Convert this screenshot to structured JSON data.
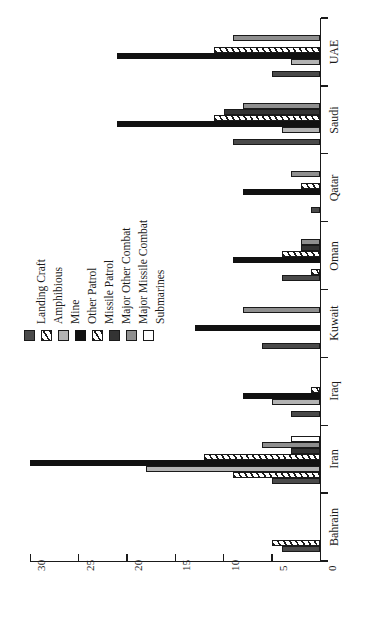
{
  "chart_data": {
    "type": "bar",
    "orientation": "horizontal-rotated",
    "title": "",
    "xlabel": "",
    "ylabel": "",
    "axis_ticks": [
      "30",
      "25",
      "20",
      "15",
      "10",
      "5",
      "0"
    ],
    "axis_tick_values": [
      30,
      25,
      20,
      15,
      10,
      5,
      0
    ],
    "xlim": [
      0,
      30
    ],
    "grid": false,
    "legend_position": "left-center",
    "categories": [
      "Bahrain",
      "Iran",
      "Iraq",
      "Kuwait",
      "Oman",
      "Qatar",
      "Saudi",
      "UAE"
    ],
    "series": [
      {
        "name": "Landing Craft",
        "swatch": "sw-landing",
        "color": "#4a4a4a",
        "values": [
          4,
          5,
          3,
          6,
          4,
          1,
          9,
          5
        ]
      },
      {
        "name": "Amphibious",
        "swatch": "sw-amph",
        "color": "#ffffff",
        "values": [
          5,
          9,
          0,
          0,
          1,
          0,
          0,
          0
        ]
      },
      {
        "name": "Mine",
        "swatch": "sw-mine",
        "color": "#b3b3b3",
        "values": [
          0,
          18,
          5,
          0,
          0,
          0,
          4,
          3
        ]
      },
      {
        "name": "Other Patrol",
        "swatch": "sw-otherpat",
        "color": "#111111",
        "values": [
          0,
          30,
          8,
          13,
          9,
          8,
          21,
          21
        ]
      },
      {
        "name": "Missile Patrol",
        "swatch": "sw-misspat",
        "color": "#ffffff",
        "values": [
          0,
          12,
          1,
          0,
          4,
          2,
          11,
          11
        ]
      },
      {
        "name": "Major Other Combat",
        "swatch": "sw-majother",
        "color": "#333333",
        "values": [
          0,
          3,
          0,
          0,
          2,
          0,
          10,
          0
        ]
      },
      {
        "name": "Major Missile Combat",
        "swatch": "sw-majmiss",
        "color": "#8f8f8f",
        "values": [
          0,
          6,
          0,
          8,
          2,
          3,
          8,
          9
        ]
      },
      {
        "name": "Submarines",
        "swatch": "sw-sub",
        "color": "#ffffff",
        "values": [
          0,
          3,
          0,
          0,
          0,
          0,
          0,
          0
        ]
      }
    ]
  },
  "legend": {
    "items": [
      {
        "label": "Landing Craft"
      },
      {
        "label": "Amphibious"
      },
      {
        "label": "Mine"
      },
      {
        "label": "Other Patrol"
      },
      {
        "label": "Missile Patrol"
      },
      {
        "label": "Major Other Combat"
      },
      {
        "label": "Major Missile Combat"
      },
      {
        "label": "Submarines"
      }
    ]
  }
}
